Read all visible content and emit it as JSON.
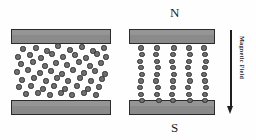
{
  "figure": {
    "background_color": "#fefefe",
    "plate_fill": "#8a8a8a",
    "plate_stroke": "#2b2b2b",
    "particle_fill": "#6e6e6e",
    "particle_stroke": "#303030",
    "arrow_color": "#1f1f1f",
    "text_color": "#1b1b1b"
  },
  "labels": {
    "north_pole": "N",
    "south_pole": "S",
    "field_label": "Magnetic Field"
  },
  "panels": [
    {
      "id": "left-panel",
      "name": "random-dispersion-panel",
      "state": "field-off",
      "plates": [
        {
          "name": "top-plate",
          "x": 11,
          "y": 29,
          "w": 100,
          "h": 15
        },
        {
          "name": "bottom-plate",
          "x": 11,
          "y": 100,
          "w": 100,
          "h": 15
        }
      ],
      "particle_count": 57,
      "particle_radius": 2.6,
      "particles": [
        [
          23,
          49
        ],
        [
          36,
          48
        ],
        [
          47,
          51
        ],
        [
          58,
          46
        ],
        [
          70,
          50
        ],
        [
          82,
          47
        ],
        [
          93,
          51
        ],
        [
          104,
          48
        ],
        [
          18,
          57
        ],
        [
          30,
          55
        ],
        [
          41,
          58
        ],
        [
          52,
          54
        ],
        [
          63,
          57
        ],
        [
          75,
          55
        ],
        [
          86,
          58
        ],
        [
          97,
          54
        ],
        [
          106,
          57
        ],
        [
          21,
          64
        ],
        [
          33,
          62
        ],
        [
          45,
          66
        ],
        [
          56,
          63
        ],
        [
          67,
          65
        ],
        [
          79,
          62
        ],
        [
          90,
          66
        ],
        [
          101,
          63
        ],
        [
          17,
          72
        ],
        [
          28,
          70
        ],
        [
          40,
          73
        ],
        [
          51,
          71
        ],
        [
          62,
          74
        ],
        [
          73,
          70
        ],
        [
          84,
          73
        ],
        [
          95,
          71
        ],
        [
          105,
          74
        ],
        [
          22,
          80
        ],
        [
          34,
          78
        ],
        [
          46,
          81
        ],
        [
          57,
          78
        ],
        [
          68,
          81
        ],
        [
          80,
          78
        ],
        [
          91,
          81
        ],
        [
          102,
          79
        ],
        [
          19,
          87
        ],
        [
          31,
          86
        ],
        [
          43,
          89
        ],
        [
          54,
          86
        ],
        [
          65,
          89
        ],
        [
          77,
          86
        ],
        [
          88,
          89
        ],
        [
          99,
          87
        ],
        [
          26,
          94
        ],
        [
          38,
          93
        ],
        [
          50,
          95
        ],
        [
          61,
          93
        ],
        [
          72,
          95
        ],
        [
          84,
          93
        ],
        [
          96,
          95
        ]
      ]
    },
    {
      "id": "right-panel",
      "name": "chain-aligned-panel",
      "state": "field-on",
      "plates": [
        {
          "name": "top-plate",
          "x": 129,
          "y": 29,
          "w": 86,
          "h": 15
        },
        {
          "name": "bottom-plate",
          "x": 129,
          "y": 100,
          "w": 86,
          "h": 15
        }
      ],
      "chain_count": 5,
      "particles_per_chain": 9,
      "particle_radius": 2.6,
      "chains": [
        {
          "name": "chain-1",
          "x": 141,
          "jitter": [
            0,
            1,
            -1,
            0,
            1,
            0,
            -1,
            0,
            1
          ]
        },
        {
          "name": "chain-2",
          "x": 157,
          "jitter": [
            0,
            -1,
            0,
            1,
            0,
            -1,
            1,
            0,
            2
          ]
        },
        {
          "name": "chain-3",
          "x": 173,
          "jitter": [
            1,
            0,
            -1,
            0,
            1,
            0,
            0,
            -1,
            0
          ]
        },
        {
          "name": "chain-4",
          "x": 189,
          "jitter": [
            0,
            1,
            0,
            -1,
            0,
            1,
            -1,
            0,
            1
          ]
        },
        {
          "name": "chain-5",
          "x": 205,
          "jitter": [
            -1,
            0,
            1,
            0,
            -1,
            0,
            1,
            0,
            0
          ]
        }
      ],
      "chain_y_start": 48,
      "chain_y_step": 6.6
    }
  ],
  "field_arrow": {
    "name": "magnetic-field-arrow",
    "direction": "down",
    "x": 230,
    "y_start": 30,
    "y_end": 113
  }
}
